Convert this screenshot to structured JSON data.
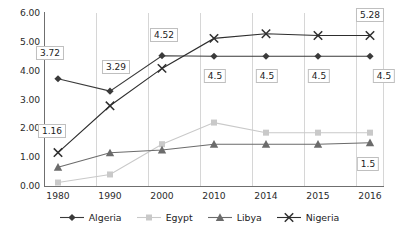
{
  "chart_data": {
    "type": "line",
    "title": "",
    "xlabel": "",
    "ylabel": "",
    "categories": [
      "1980",
      "1990",
      "2000",
      "2010",
      "2014",
      "2015",
      "2016"
    ],
    "ylim": [
      0,
      6
    ],
    "ytick_labels": [
      "0.00",
      "1.00",
      "2.00",
      "3.00",
      "4.00",
      "5.00",
      "6.00"
    ],
    "ytick_values": [
      0,
      1,
      2,
      3,
      4,
      5,
      6
    ],
    "grid": "vertical",
    "legend_position": "bottom",
    "series": [
      {
        "name": "Algeria",
        "marker": "diamond",
        "color": "#3a3a3a",
        "values": [
          3.72,
          3.29,
          4.52,
          4.5,
          4.5,
          4.5,
          4.5
        ]
      },
      {
        "name": "Egypt",
        "marker": "square",
        "color": "#c9c9c9",
        "values": [
          0.12,
          0.4,
          1.45,
          2.2,
          1.85,
          1.85,
          1.85
        ]
      },
      {
        "name": "Libya",
        "marker": "triangle",
        "color": "#6b6b6b",
        "values": [
          0.65,
          1.15,
          1.25,
          1.45,
          1.45,
          1.45,
          1.5
        ]
      },
      {
        "name": "Nigeria",
        "marker": "x",
        "color": "#2e2e2e",
        "values": [
          1.16,
          2.78,
          4.08,
          5.12,
          5.28,
          5.22,
          5.22
        ]
      }
    ],
    "annotations": [
      {
        "text": "3.72",
        "series": "Algeria",
        "category": "1980",
        "dx": -8,
        "dy": -26
      },
      {
        "text": "1.16",
        "series": "Nigeria",
        "category": "1980",
        "dx": -6,
        "dy": -22
      },
      {
        "text": "3.29",
        "series": "Algeria",
        "category": "1990",
        "dx": 6,
        "dy": -24
      },
      {
        "text": "4.52",
        "series": "Algeria",
        "category": "2000",
        "dx": 2,
        "dy": -21
      },
      {
        "text": "4.5",
        "series": "Algeria",
        "category": "2010",
        "dx": 1,
        "dy": 20
      },
      {
        "text": "4.5",
        "series": "Algeria",
        "category": "2014",
        "dx": 1,
        "dy": 20
      },
      {
        "text": "4.5",
        "series": "Algeria",
        "category": "2015",
        "dx": 1,
        "dy": 20
      },
      {
        "text": "4.5",
        "series": "Algeria",
        "category": "2016",
        "dx": 14,
        "dy": 20
      },
      {
        "text": "5.28",
        "series": "Nigeria",
        "category": "2016",
        "dx": 0,
        "dy": -20
      },
      {
        "text": "1.5",
        "series": "Libya",
        "category": "2016",
        "dx": -2,
        "dy": 21
      }
    ]
  }
}
